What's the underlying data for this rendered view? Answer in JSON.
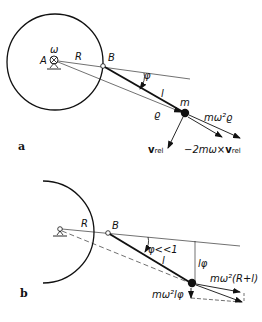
{
  "figure": {
    "panel_a": {
      "panel_label": "a",
      "labels": {
        "pivot": "A",
        "omega": "ω",
        "radius": "R",
        "point_b": "B",
        "angle": "φ",
        "length": "l",
        "mass": "m",
        "position_vector": "ϱ",
        "centrifugal_force": "mω²ϱ",
        "relative_velocity": "v",
        "relative_velocity_sub": "rel",
        "coriolis_force_prefix": "−2mω×",
        "coriolis_force_vec": "v",
        "coriolis_force_sub": "rel"
      }
    },
    "panel_b": {
      "panel_label": "b",
      "labels": {
        "radius": "R",
        "point_b": "B",
        "angle": "φ<<1",
        "length": "l",
        "deflection": "lφ",
        "radial_force": "mω²(R+l)",
        "transverse_force": "mω²lφ"
      }
    }
  }
}
